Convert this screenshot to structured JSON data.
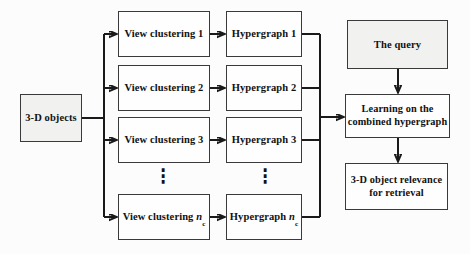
{
  "colors": {
    "background": "#fcfcfc",
    "box_border": "#3a3a3a",
    "shaded_fill": "#f1f1ef",
    "white_fill": "#fefefe",
    "line": "#1a1a1a",
    "text": "#111111"
  },
  "nodes": {
    "objects": {
      "label": "3-D objects"
    },
    "view_clustering": [
      {
        "prefix": "View clustering 1",
        "var": "",
        "sub": ""
      },
      {
        "prefix": "View clustering 2",
        "var": "",
        "sub": ""
      },
      {
        "prefix": "View clustering 3",
        "var": "",
        "sub": ""
      },
      {
        "prefix": "View clustering ",
        "var": "n",
        "sub": "c"
      }
    ],
    "hypergraphs": [
      {
        "prefix": "Hypergraph 1",
        "var": "",
        "sub": ""
      },
      {
        "prefix": "Hypergraph 2",
        "var": "",
        "sub": ""
      },
      {
        "prefix": "Hypergraph 3",
        "var": "",
        "sub": ""
      },
      {
        "prefix": "Hypergraph ",
        "var": "n",
        "sub": "c"
      }
    ],
    "query": {
      "label": "The query"
    },
    "learning": {
      "line1": "Learning on the",
      "line2": "combined hypergraph"
    },
    "relevance": {
      "line1": "3-D object relevance",
      "line2": "for retrieval"
    }
  },
  "decor": {
    "ellipsis": "⋮"
  }
}
